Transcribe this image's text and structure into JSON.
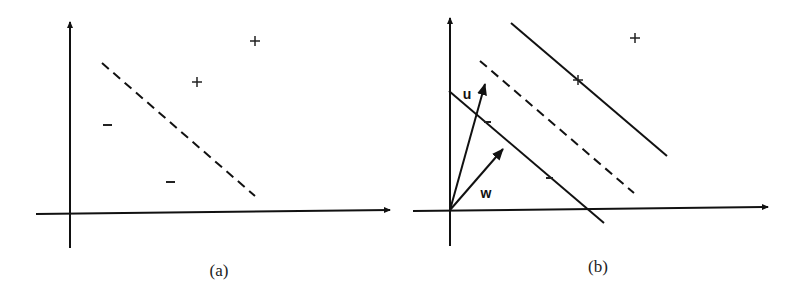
{
  "figure": {
    "panels": [
      {
        "id": "a",
        "caption": "(a)",
        "positive_marks": [
          "+",
          "+"
        ],
        "negative_marks": [
          "-",
          "-"
        ],
        "separator": "dashed decision boundary"
      },
      {
        "id": "b",
        "caption": "(b)",
        "vector_labels": {
          "u": "u",
          "w": "w"
        },
        "positive_marks": [
          "+",
          "+"
        ],
        "negative_marks": [
          "-",
          "-"
        ],
        "separators": [
          "upper margin (solid)",
          "decision boundary (dashed)",
          "lower margin (solid)"
        ]
      }
    ]
  },
  "colors": {
    "ink": "#111111",
    "background": "#ffffff"
  }
}
